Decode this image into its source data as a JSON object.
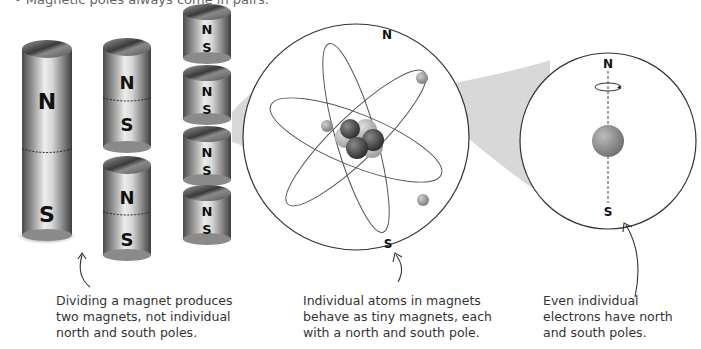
{
  "header": {
    "bullet_text": "• Magnetic poles always come in pairs."
  },
  "figure": {
    "long_magnet": {
      "north": "N",
      "south": "S"
    },
    "split_magnets": [
      {
        "north": "N",
        "south": "S"
      },
      {
        "north": "N",
        "south": "S"
      }
    ],
    "small_magnets": [
      {
        "north": "N",
        "south": "S"
      },
      {
        "north": "N",
        "south": "S"
      },
      {
        "north": "N",
        "south": "S"
      },
      {
        "north": "N",
        "south": "S"
      }
    ],
    "atom_circle": {
      "north": "N",
      "south": "S"
    },
    "electron_circle": {
      "north": "N",
      "south": "S"
    }
  },
  "captions": {
    "magnet": "Dividing a magnet produces two magnets, not individual north and south poles.",
    "atom": "Individual atoms in magnets behave as tiny magnets, each with a north and south pole.",
    "electron": "Even individual electrons have north and south poles."
  },
  "colors": {
    "magnet_light": "#e6e6e6",
    "magnet_dark": "#5a5a5a",
    "zoom_wedge": "#d6d6d6",
    "outline": "#333333"
  }
}
